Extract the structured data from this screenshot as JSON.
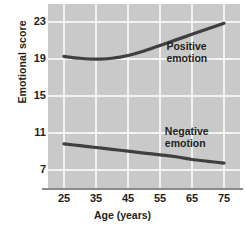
{
  "chart_data": {
    "type": "line",
    "title": "",
    "xlabel": "Age (years)",
    "ylabel": "Emotional score",
    "xlim": [
      20,
      80
    ],
    "ylim": [
      5,
      25
    ],
    "xticks": [
      25,
      35,
      45,
      55,
      65,
      75
    ],
    "yticks": [
      7,
      11,
      15,
      19,
      23
    ],
    "grid": true,
    "legend_position": "inline-annotation",
    "plot_background": "#c9c9c9",
    "gridline_color": "#f2f2f2",
    "line_color": "#3f3f3f",
    "x": [
      25,
      30,
      35,
      40,
      45,
      50,
      55,
      60,
      65,
      70,
      75
    ],
    "series": [
      {
        "name": "Positive emotion",
        "label": "Positive\nemotion",
        "values": [
          19.3,
          19.1,
          19.0,
          19.1,
          19.4,
          19.9,
          20.5,
          21.1,
          21.7,
          22.3,
          22.9
        ]
      },
      {
        "name": "Negative emotion",
        "label": "Negative\nemotion",
        "values": [
          9.8,
          9.6,
          9.4,
          9.2,
          9.0,
          8.8,
          8.6,
          8.4,
          8.1,
          7.9,
          7.7
        ]
      }
    ]
  },
  "axes": {
    "y_title": "Emotional score",
    "x_title": "Age (years)",
    "y_tick_labels": [
      "23",
      "19",
      "15",
      "11",
      "7"
    ],
    "x_tick_labels": [
      "25",
      "35",
      "45",
      "55",
      "65",
      "75"
    ]
  },
  "annotations": {
    "positive": "Positive\nemotion",
    "negative": "Negative\nemotion"
  }
}
